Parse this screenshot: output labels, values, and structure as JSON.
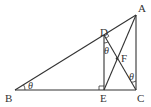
{
  "diagram": {
    "points": {
      "A": {
        "label": "A",
        "x": 136,
        "y": 15
      },
      "B": {
        "label": "B",
        "x": 15,
        "y": 90
      },
      "C": {
        "label": "C",
        "x": 136,
        "y": 90
      },
      "D": {
        "label": "D",
        "x": 104,
        "y": 35
      },
      "E": {
        "label": "E",
        "x": 104,
        "y": 90
      },
      "F": {
        "label": "F",
        "x": 117,
        "y": 59
      }
    },
    "angle_symbol": "θ",
    "segments": [
      "AB",
      "BC",
      "AC",
      "DE",
      "DC",
      "AE"
    ],
    "right_angles": [
      "D",
      "E"
    ],
    "angles_marked": [
      "B",
      "EDC",
      "ACD"
    ]
  }
}
